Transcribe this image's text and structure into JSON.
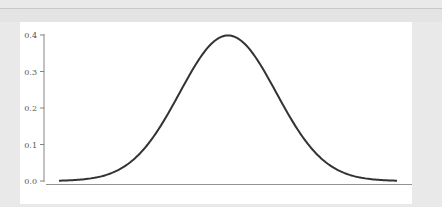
{
  "chart_data": {
    "type": "line",
    "title": "",
    "xlabel": "",
    "ylabel": "",
    "series": [
      {
        "name": "normal pdf",
        "mean": 0,
        "std": 1,
        "x": [
          -3.5,
          -3.0,
          -2.5,
          -2.0,
          -1.5,
          -1.0,
          -0.5,
          0.0,
          0.5,
          1.0,
          1.5,
          2.0,
          2.5,
          3.0,
          3.5
        ],
        "values": [
          0.001,
          0.004,
          0.018,
          0.054,
          0.13,
          0.242,
          0.352,
          0.399,
          0.352,
          0.242,
          0.13,
          0.054,
          0.018,
          0.004,
          0.001
        ]
      }
    ],
    "yticks": [
      "0.0",
      "0.1",
      "0.2",
      "0.3",
      "0.4"
    ],
    "ylim": [
      0,
      0.4
    ],
    "xlim": [
      -3.5,
      3.5
    ],
    "grid": false,
    "legend": false,
    "line_color": "#333333"
  }
}
